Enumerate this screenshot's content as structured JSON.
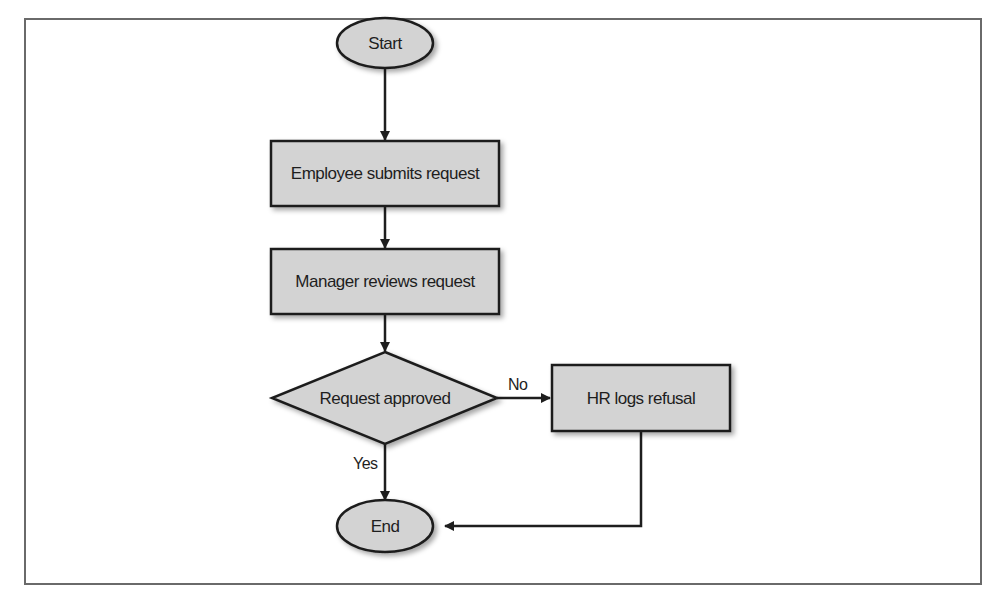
{
  "diagram": {
    "type": "flowchart",
    "nodes": {
      "start": {
        "label": "Start",
        "shape": "ellipse"
      },
      "submit": {
        "label": "Employee submits request",
        "shape": "rectangle"
      },
      "review": {
        "label": "Manager reviews request",
        "shape": "rectangle"
      },
      "decision": {
        "label": "Request approved",
        "shape": "diamond"
      },
      "refusal": {
        "label": "HR logs refusal",
        "shape": "rectangle"
      },
      "end": {
        "label": "End",
        "shape": "ellipse"
      }
    },
    "edges": {
      "no_label": "No",
      "yes_label": "Yes"
    },
    "colors": {
      "node_fill": "#d3d3d3",
      "stroke": "#1e1e1e",
      "frame": "#6a6a6a"
    }
  }
}
